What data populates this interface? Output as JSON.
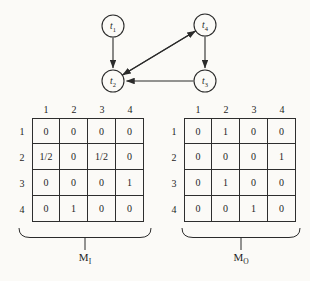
{
  "figure": {
    "background": "#fbfaf7",
    "ink": "#2b2b2b"
  },
  "graph": {
    "nodes": [
      {
        "id": "t1",
        "base": "t",
        "sub": "1"
      },
      {
        "id": "t4",
        "base": "t",
        "sub": "4"
      },
      {
        "id": "t2",
        "base": "t",
        "sub": "2"
      },
      {
        "id": "t3",
        "base": "t",
        "sub": "3"
      }
    ],
    "edges": [
      {
        "from": "t1",
        "to": "t2",
        "bidirectional": false
      },
      {
        "from": "t4",
        "to": "t3",
        "bidirectional": false
      },
      {
        "from": "t3",
        "to": "t2",
        "bidirectional": false
      },
      {
        "from": "t2",
        "to": "t4",
        "bidirectional": true
      }
    ]
  },
  "matrices": [
    {
      "name": "M",
      "subscript": "I",
      "col_headers": [
        "1",
        "2",
        "3",
        "4"
      ],
      "row_headers": [
        "1",
        "2",
        "3",
        "4"
      ],
      "rows": [
        [
          "0",
          "0",
          "0",
          "0"
        ],
        [
          "1/2",
          "0",
          "1/2",
          "0"
        ],
        [
          "0",
          "0",
          "0",
          "1"
        ],
        [
          "0",
          "1",
          "0",
          "0"
        ]
      ]
    },
    {
      "name": "M",
      "subscript": "O",
      "col_headers": [
        "1",
        "2",
        "3",
        "4"
      ],
      "row_headers": [
        "1",
        "2",
        "3",
        "4"
      ],
      "rows": [
        [
          "0",
          "1",
          "0",
          "0"
        ],
        [
          "0",
          "0",
          "0",
          "1"
        ],
        [
          "0",
          "1",
          "0",
          "0"
        ],
        [
          "0",
          "0",
          "1",
          "0"
        ]
      ]
    }
  ]
}
